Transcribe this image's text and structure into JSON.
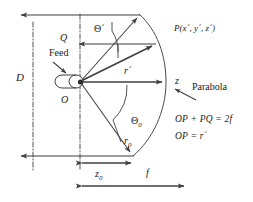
{
  "figure": {
    "type": "technical-line-diagram",
    "background_color": "#ffffff",
    "line_color": "#3f3f3f",
    "text_color": "#1a1a1a",
    "width": 253,
    "height": 202
  },
  "labels": {
    "aperture_diameter": "D",
    "point_q": "Q",
    "feed": "Feed",
    "origin": "O",
    "theta_prime": "Θ´",
    "theta_zero": "Θ",
    "theta_zero_sub": "0",
    "r_prime": "r´",
    "r_zero": "r",
    "r_zero_sub": "0",
    "z_axis": "z",
    "z_sub_zero": "z",
    "z_sub_zero_sub": "0",
    "focal_length": "f",
    "parabola": "Parabola",
    "point_p": "P(x´, y´, z´)"
  },
  "equations": {
    "line1": "OP + PQ = 2f",
    "line2": "OP  = r´"
  },
  "geometry": {
    "origin_point": [
      80,
      82
    ],
    "parabola_vertex_on_axis": [
      166,
      82
    ],
    "parabola_top": [
      140,
      15
    ],
    "parabola_bottom": [
      133,
      156
    ],
    "point_p": [
      155,
      44
    ],
    "focal_length_px": 107,
    "z0_px": 55
  }
}
